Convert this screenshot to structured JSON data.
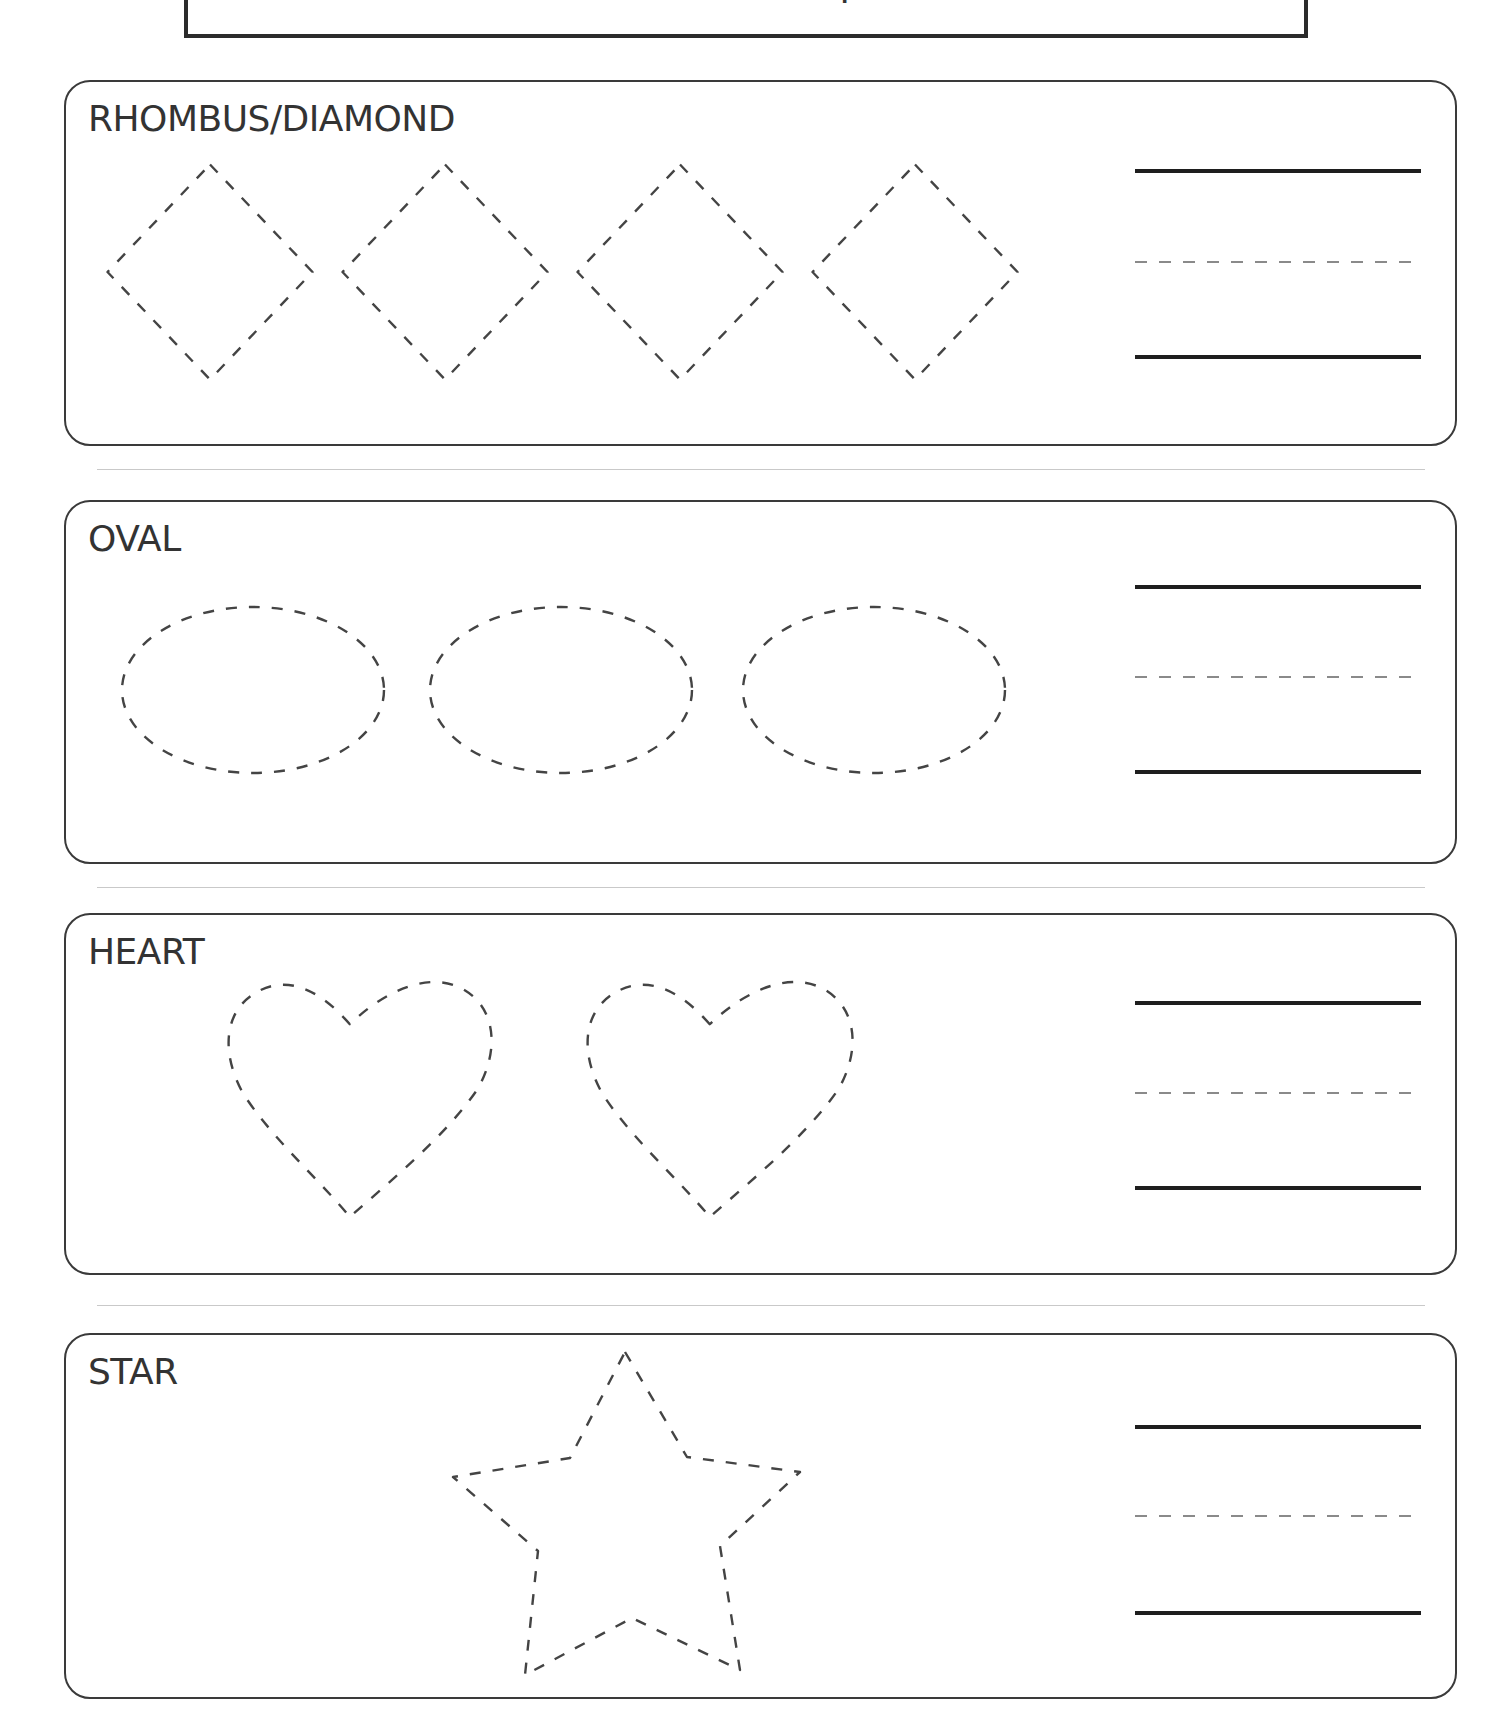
{
  "worksheet": {
    "title_partial": "Trace the shapes",
    "sections": [
      {
        "label": "RHOMBUS/DIAMOND",
        "shape": "rhombus",
        "count": 4,
        "box": {
          "top": 80,
          "height": 366
        },
        "guide_lines_y": [
          171,
          262,
          357
        ],
        "items": [
          {
            "cx": 210,
            "cy": 272,
            "w": 205,
            "h": 215
          },
          {
            "cx": 445,
            "cy": 272,
            "w": 205,
            "h": 215
          },
          {
            "cx": 680,
            "cy": 272,
            "w": 205,
            "h": 215
          },
          {
            "cx": 915,
            "cy": 272,
            "w": 205,
            "h": 215
          }
        ]
      },
      {
        "label": "OVAL",
        "shape": "oval",
        "count": 3,
        "box": {
          "top": 500,
          "height": 364
        },
        "guide_lines_y": [
          587,
          677,
          772
        ],
        "items": [
          {
            "cx": 253,
            "cy": 690,
            "rx": 131,
            "ry": 83
          },
          {
            "cx": 561,
            "cy": 690,
            "rx": 131,
            "ry": 83
          },
          {
            "cx": 874,
            "cy": 690,
            "rx": 131,
            "ry": 83
          }
        ]
      },
      {
        "label": "HEART",
        "shape": "heart",
        "count": 2,
        "box": {
          "top": 913,
          "height": 362
        },
        "guide_lines_y": [
          1003,
          1093,
          1188
        ],
        "items": [
          {
            "left": 227,
            "top": 979,
            "w": 267,
            "h": 238
          },
          {
            "left": 586,
            "top": 979,
            "w": 269,
            "h": 238
          }
        ]
      },
      {
        "label": "STAR",
        "shape": "star",
        "count": 1,
        "box": {
          "top": 1333,
          "height": 366
        },
        "guide_lines_y": [
          1427,
          1516,
          1613
        ],
        "items": [
          {
            "points": "625,1352 687,1457 800,1472 720,1546 740,1670 632,1618 525,1675 538,1551 453,1477 570,1458"
          }
        ]
      }
    ],
    "separators_y": [
      469,
      887,
      1305
    ]
  }
}
